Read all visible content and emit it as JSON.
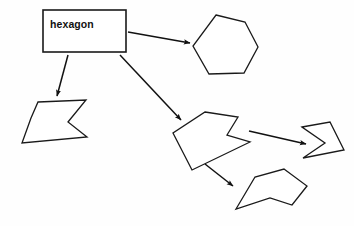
{
  "canvas": {
    "width": 354,
    "height": 226,
    "background_color": "#fefefe",
    "stroke_color": "#1a1a1a",
    "text_color": "#111111"
  },
  "diagram": {
    "type": "shape-annotation-diagram",
    "label_box": {
      "text": "hexagon",
      "x": 43,
      "y": 10,
      "width": 83,
      "height": 42,
      "label_x": 50,
      "label_y": 19
    },
    "shapes": [
      {
        "name": "hexagon-shape",
        "kind": "hexagon",
        "points": "216,15 245,22 258,47 244,73 209,74 193,46"
      },
      {
        "name": "left-arrow-polygon",
        "kind": "irregular-arrow",
        "points": "38,102 86,100 68,122 87,137 22,143 31,118"
      },
      {
        "name": "center-arrow-polygon",
        "kind": "irregular-arrow",
        "points": "205,112 238,117 227,135 250,142 192,170 173,133"
      },
      {
        "name": "right-arrow-polygon",
        "kind": "chevron-arrow",
        "points": "302,127 330,122 344,150 303,158 325,143"
      },
      {
        "name": "bottom-pentagon-polygon",
        "kind": "irregular-pentagon",
        "points": "284,169 307,186 292,205 270,198 236,209 255,177"
      }
    ],
    "connectors": [
      {
        "name": "connector-box-to-hexagon",
        "from": "label-box",
        "to": "hexagon-shape",
        "x1": 128,
        "y1": 32,
        "x2": 190,
        "y2": 43
      },
      {
        "name": "connector-box-to-left-shape",
        "from": "label-box",
        "to": "left-arrow-polygon",
        "x1": 68,
        "y1": 55,
        "x2": 57,
        "y2": 96
      },
      {
        "name": "connector-box-to-center-shape",
        "from": "label-box",
        "to": "center-arrow-polygon",
        "x1": 120,
        "y1": 55,
        "x2": 181,
        "y2": 120
      },
      {
        "name": "connector-center-to-right-shape",
        "from": "center-arrow-polygon",
        "to": "right-arrow-polygon",
        "x1": 249,
        "y1": 131,
        "x2": 306,
        "y2": 144
      },
      {
        "name": "connector-center-to-bottom-shape",
        "from": "center-arrow-polygon",
        "to": "bottom-pentagon-polygon",
        "x1": 205,
        "y1": 164,
        "x2": 233,
        "y2": 186
      }
    ]
  }
}
